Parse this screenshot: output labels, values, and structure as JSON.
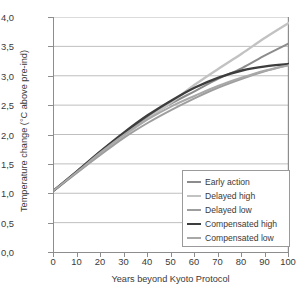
{
  "chart_data": {
    "type": "line",
    "title": "",
    "xlabel": "Years beyond Kyoto Protocol",
    "ylabel": "Temperature change (°C above pre-ind)",
    "xlim": [
      0,
      100
    ],
    "ylim": [
      0.0,
      4.0
    ],
    "grid": "horizontal",
    "legend_position": "bottom-right",
    "x": [
      0,
      10,
      20,
      30,
      40,
      50,
      60,
      70,
      80,
      90,
      100
    ],
    "xticklabels": [
      "0",
      "10",
      "20",
      "30",
      "40",
      "50",
      "60",
      "70",
      "80",
      "90",
      "100"
    ],
    "yticks": [
      0.0,
      0.5,
      1.0,
      1.5,
      2.0,
      2.5,
      3.0,
      3.5,
      4.0
    ],
    "yticklabels": [
      "0,0",
      "0,5",
      "1,0",
      "1,5",
      "2,0",
      "2,5",
      "3,0",
      "3,5",
      "4,0"
    ],
    "series": [
      {
        "name": "Early action",
        "color": "#8c8c8c",
        "width": 2.0,
        "values": [
          1.05,
          1.38,
          1.72,
          2.02,
          2.3,
          2.53,
          2.74,
          2.95,
          3.13,
          3.35,
          3.55
        ]
      },
      {
        "name": "Delayed high",
        "color": "#c2c2c2",
        "width": 2.4,
        "values": [
          1.05,
          1.36,
          1.68,
          1.98,
          2.27,
          2.55,
          2.85,
          3.12,
          3.38,
          3.65,
          3.9
        ]
      },
      {
        "name": "Delayed low",
        "color": "#9e9e9e",
        "width": 2.0,
        "values": [
          1.05,
          1.36,
          1.66,
          1.95,
          2.2,
          2.42,
          2.62,
          2.8,
          2.95,
          3.08,
          3.19
        ]
      },
      {
        "name": "Compensated high",
        "color": "#3d3d3d",
        "width": 2.4,
        "values": [
          1.05,
          1.38,
          1.72,
          2.04,
          2.33,
          2.58,
          2.8,
          2.97,
          3.09,
          3.16,
          3.2
        ]
      },
      {
        "name": "Compensated low",
        "color": "#a8a8a8",
        "width": 2.0,
        "values": [
          1.05,
          1.37,
          1.7,
          2.0,
          2.26,
          2.48,
          2.66,
          2.83,
          2.97,
          3.09,
          3.18
        ]
      }
    ]
  },
  "legend": {
    "items": [
      {
        "label": "Early action"
      },
      {
        "label": "Delayed high"
      },
      {
        "label": "Delayed low"
      },
      {
        "label": "Compensated high"
      },
      {
        "label": "Compensated low"
      }
    ]
  }
}
